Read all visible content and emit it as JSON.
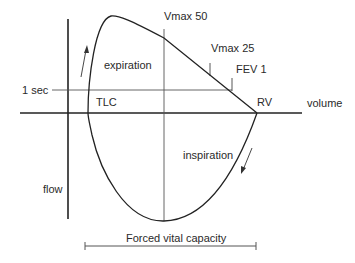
{
  "diagram": {
    "labels": {
      "vmax50": "Vmax 50",
      "vmax25": "Vmax 25",
      "fev1": "FEV 1",
      "expiration": "expiration",
      "inspiration": "inspiration",
      "one_sec": "1 sec",
      "tlc": "TLC",
      "rv": "RV",
      "volume": "volume",
      "flow": "flow",
      "fvc": "Forced vital capacity"
    },
    "colors": {
      "line": "#222222",
      "thin_line": "#555555",
      "text": "#2a2a2a"
    }
  }
}
